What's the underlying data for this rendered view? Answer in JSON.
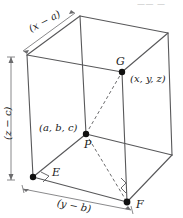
{
  "figure": {
    "stroke_color": "#58585a",
    "dash_color": "#6b6b6d",
    "point_color": "#101010",
    "background": "#ffffff",
    "cropped_header_text": "—— —"
  },
  "points": [
    {
      "id": "G",
      "label": "G",
      "x": 122,
      "y": 72
    },
    {
      "id": "P",
      "label": "P",
      "x": 86,
      "y": 134
    },
    {
      "id": "E",
      "label": "E",
      "x": 33,
      "y": 177
    },
    {
      "id": "F",
      "label": "F",
      "x": 127,
      "y": 202
    }
  ],
  "labels": {
    "point_g": "G",
    "point_p": "P",
    "point_e": "E",
    "point_f": "F",
    "coord_g": "(x, y, z)",
    "coord_p": "(a, b, c)",
    "dim_top": "(x − a)",
    "dim_bottom": "(y − b)",
    "dim_left": "(z − c)"
  },
  "geometry": {
    "box_vertices": {
      "front_bottom_left": [
        33,
        177
      ],
      "front_bottom_right": [
        127,
        202
      ],
      "front_top_left": [
        27,
        55
      ],
      "front_top_right": [
        122,
        72
      ],
      "back_bottom_left": [
        86,
        134
      ],
      "back_bottom_right": [
        172,
        155
      ],
      "back_top_left": [
        80,
        16
      ],
      "back_top_right": [
        168,
        33
      ]
    },
    "dashed_segments": [
      {
        "from": "P",
        "to": "G"
      },
      {
        "from": "P",
        "to": "F"
      }
    ],
    "right_angle_marks": [
      "E",
      "F"
    ]
  }
}
